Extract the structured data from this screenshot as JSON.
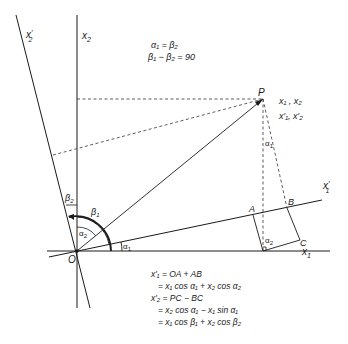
{
  "diagram": {
    "axes": {
      "x1": {
        "label": "x",
        "sub": "1",
        "prime": ""
      },
      "x2": {
        "label": "x",
        "sub": "2",
        "prime": ""
      },
      "x1_prime": {
        "label": "x",
        "sub": "1",
        "prime": "′"
      },
      "x2_prime": {
        "label": "x",
        "sub": "2",
        "prime": "′"
      }
    },
    "points": {
      "origin": "O",
      "P": "P",
      "A": "A",
      "B": "B",
      "C": "C"
    },
    "point_P_coords": {
      "line1": "x₁ , x₂",
      "line2": "x′₁, x′₂"
    },
    "angles": {
      "alpha1": {
        "sym": "α",
        "sub": "1"
      },
      "alpha2": {
        "sym": "α",
        "sub": "2"
      },
      "beta1": {
        "sym": "β",
        "sub": "1"
      },
      "beta2": {
        "sym": "β",
        "sub": "2"
      }
    },
    "relations": {
      "line1": "α₁ = β₂",
      "line2": "β₁ − β₂ = 90"
    },
    "equations": [
      "x′₁ = OA + AB",
      "= x₁ cos α₁ + x₂ cos α₂",
      "x′₂ = PC − BC",
      "= x₂ cos α₁ − x₁ sin α₁",
      "= x₁ cos β₁ + x₂ cos β₂"
    ]
  }
}
